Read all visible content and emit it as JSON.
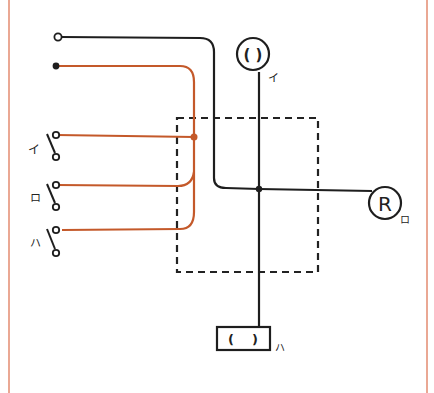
{
  "diagram": {
    "type": "wiring-diagram",
    "colors": {
      "frame": "#eaa894",
      "black_wire": "#1e1e1e",
      "orange_wire": "#c4592a",
      "dashed_box": "#222222"
    },
    "power_terminals": [
      {
        "id": "neutral",
        "symbol": "open-circle"
      },
      {
        "id": "line",
        "symbol": "filled-circle"
      }
    ],
    "switches": [
      {
        "label": "イ"
      },
      {
        "label": "ロ"
      },
      {
        "label": "ハ"
      }
    ],
    "loads": [
      {
        "id": "lamp-circle",
        "inner_text": "( )",
        "label": "イ"
      },
      {
        "id": "receptacle",
        "inner_text": "R",
        "label": "ロ"
      },
      {
        "id": "lamp-rect",
        "inner_text": "(    )",
        "label": "ハ"
      }
    ],
    "junction_box": {
      "style": "dashed"
    }
  }
}
